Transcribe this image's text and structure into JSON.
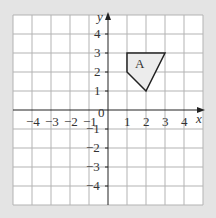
{
  "figure": {
    "axes": {
      "x_label": "x",
      "y_label": "y",
      "origin_label": "0",
      "x_ticks": [
        "-4",
        "-3",
        "-2",
        "-1",
        "1",
        "2",
        "3",
        "4"
      ],
      "y_ticks": [
        "4",
        "3",
        "2",
        "1",
        "-1",
        "-2",
        "-3",
        "-4"
      ],
      "x_range": [
        -5,
        5
      ],
      "y_range": [
        -5,
        5
      ]
    },
    "shape": {
      "label": "A",
      "vertices": [
        [
          1,
          3
        ],
        [
          3,
          3
        ],
        [
          2,
          1
        ],
        [
          1,
          2
        ]
      ],
      "fill": "#ececec",
      "stroke": "#222222"
    },
    "colors": {
      "background": "#e4e4e4",
      "panel": "#ffffff",
      "grid": "#b0b0b0",
      "axis": "#222222"
    }
  }
}
